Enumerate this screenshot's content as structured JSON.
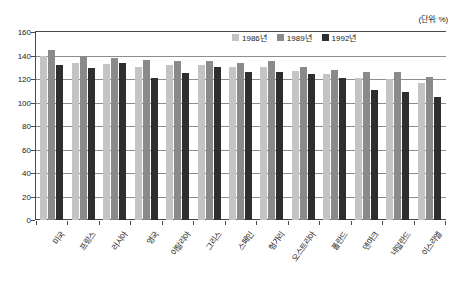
{
  "unit_note": "(단위: %)",
  "legend": {
    "position": "top-right-inside",
    "entries": [
      {
        "label": "1986년",
        "color": "#c4c4c4"
      },
      {
        "label": "1989년",
        "color": "#8a8a8a"
      },
      {
        "label": "1992년",
        "color": "#2e2e2e"
      }
    ]
  },
  "chart_data": {
    "type": "bar",
    "title": "",
    "subtitle": "",
    "xlabel": "",
    "ylabel": "",
    "unit": "(단위: %)",
    "ylim": [
      0,
      160
    ],
    "yticks": [
      0,
      20,
      40,
      60,
      80,
      100,
      120,
      140,
      160
    ],
    "ytick_labels": [
      "0",
      "20",
      "40",
      "60",
      "80",
      "100",
      "120",
      "140",
      "160"
    ],
    "grid": true,
    "grid_axis": "y",
    "legend_position": "upper right",
    "categories": [
      "미국",
      "프랑스",
      "러시아",
      "영국",
      "이탈리아",
      "그리스",
      "스페인",
      "헝가리",
      "오스트리아",
      "폴란드",
      "덴마크",
      "네덜란드",
      "이스라엘"
    ],
    "series": [
      {
        "name": "1986년",
        "color": "#c4c4c4",
        "values": [
          140,
          134,
          133,
          130,
          132,
          132,
          130,
          130,
          127,
          124,
          121,
          120,
          117
        ]
      },
      {
        "name": "1989년",
        "color": "#8a8a8a",
        "values": [
          145,
          140,
          138,
          136,
          135,
          135,
          134,
          135,
          130,
          128,
          126,
          126,
          122
        ]
      },
      {
        "name": "1992년",
        "color": "#2e2e2e",
        "values": [
          132,
          129,
          134,
          121,
          125,
          130,
          126,
          126,
          124,
          121,
          111,
          109,
          105
        ]
      }
    ]
  }
}
